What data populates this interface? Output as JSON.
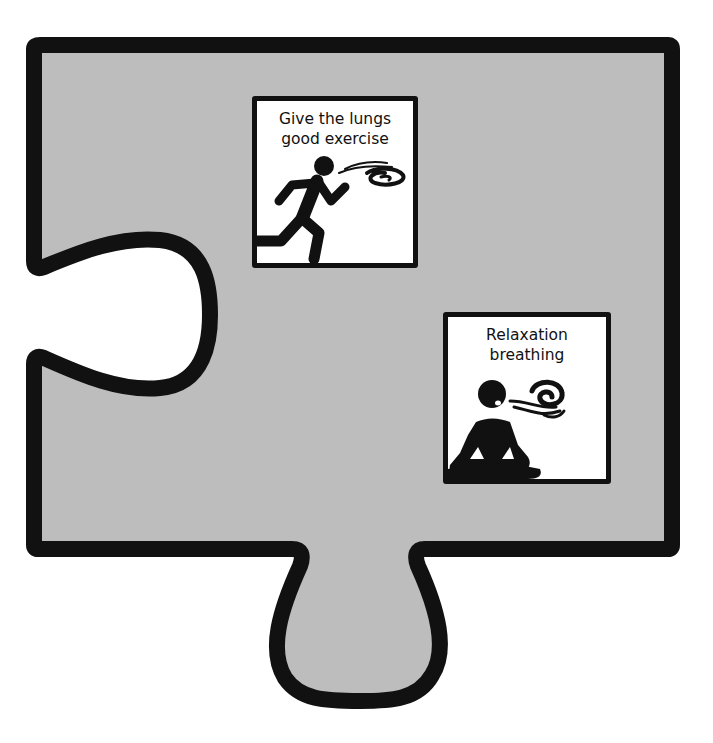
{
  "puzzle_piece": {
    "shape": "jigsaw-piece",
    "fill_color": "#bdbdbd",
    "outline_color": "#111111",
    "background_color": "#ffffff",
    "features": [
      "left-socket",
      "bottom-tab"
    ]
  },
  "cards": [
    {
      "id": "lungs-exercise",
      "title": "Give the lungs\ngood exercise",
      "icon": "running-person-breath-icon"
    },
    {
      "id": "relaxation-breathing",
      "title": "Relaxation\nbreathing",
      "icon": "meditating-person-breath-icon"
    }
  ]
}
